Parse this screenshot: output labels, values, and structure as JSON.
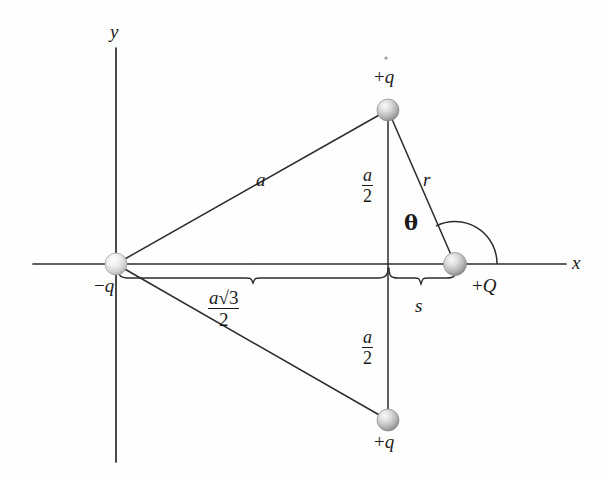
{
  "figure": {
    "kind": "physics-diagram",
    "background_color": "#fefefe",
    "line_color": "#2b2b2b",
    "sphere_color_light": "#f2f2f2",
    "sphere_color_mid": "#b9b9b9",
    "sphere_color_dark": "#8e8e8e"
  },
  "axes": {
    "x_label": "x",
    "y_label": "y",
    "origin": {
      "x": 116,
      "y": 264
    },
    "x_start": 33,
    "x_end": 566,
    "y_top": 48,
    "y_bottom": 462
  },
  "charges": [
    {
      "id": "charge-top",
      "label_prefix": "+",
      "label_symbol": "q",
      "label": "+q",
      "x": 388,
      "y": 110,
      "radius": 11,
      "label_x": 388,
      "label_y": 78
    },
    {
      "id": "charge-left",
      "label_prefix": "−",
      "label_symbol": "q",
      "label": "−q",
      "x": 116,
      "y": 264,
      "radius": 11,
      "label_x": 108,
      "label_y": 287
    },
    {
      "id": "charge-bottom",
      "label_prefix": "+",
      "label_symbol": "q",
      "label": "+q",
      "x": 388,
      "y": 420,
      "radius": 11,
      "label_x": 388,
      "label_y": 443
    },
    {
      "id": "charge-right",
      "label_prefix": "+",
      "label_symbol": "Q",
      "label": "+Q",
      "x": 455,
      "y": 264,
      "radius": 12,
      "label_x": 492,
      "label_y": 287
    }
  ],
  "segments": [
    {
      "id": "seg-a",
      "label": "a",
      "from": "charge-left",
      "to": "charge-top",
      "label_x": 262,
      "label_y": 180
    },
    {
      "id": "seg-a-lower",
      "label": "",
      "from": "charge-left",
      "to": "charge-bottom",
      "label_x": 0,
      "label_y": 0
    },
    {
      "id": "seg-r",
      "label": "r",
      "from": "charge-top",
      "to": "charge-right",
      "label_x": 427,
      "label_y": 180
    },
    {
      "id": "seg-vertical",
      "label": "",
      "from": "charge-top",
      "to": "charge-bottom",
      "label_x": 0,
      "label_y": 0
    }
  ],
  "measure_labels": {
    "half_a_upper": {
      "numerator": "a",
      "denominator": "2",
      "x": 366,
      "y": 172
    },
    "half_a_lower": {
      "numerator": "a",
      "denominator": "2",
      "x": 366,
      "y": 334
    },
    "a_sqrt3_over_2": {
      "numerator_a": "a",
      "numerator_radical": "√3",
      "denominator": "2",
      "x": 227,
      "y": 297
    },
    "s": {
      "label": "s",
      "x": 418,
      "y": 298
    }
  },
  "angle": {
    "label": "θ",
    "vertex_x": 455,
    "vertex_y": 264,
    "radius": 42,
    "label_x": 410,
    "label_y": 214
  },
  "braces": [
    {
      "id": "brace-a-sqrt3",
      "from_x": 118,
      "to_x": 388,
      "y": 277,
      "label": "a√3 / 2"
    },
    {
      "id": "brace-s",
      "from_x": 389,
      "to_x": 456,
      "y": 277,
      "label": "s"
    }
  ]
}
